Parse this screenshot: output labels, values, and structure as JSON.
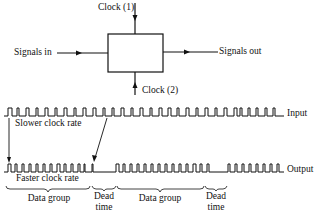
{
  "block_diagram": {
    "clock1_label": "Clock (1)",
    "clock2_label": "Clock (2)",
    "input_label": "Signals in",
    "output_label": "Signals out"
  },
  "timing": {
    "input_trace_label": "Input",
    "output_trace_label": "Output",
    "slower_label": "Slower clock rate",
    "faster_label": "Faster clock rate",
    "groups": [
      {
        "label": "Data group"
      },
      {
        "label": "Dead time"
      },
      {
        "label": "Data group"
      },
      {
        "label": "Dead time"
      }
    ]
  },
  "colors": {
    "ink": "#111111",
    "background": "#ffffff"
  }
}
